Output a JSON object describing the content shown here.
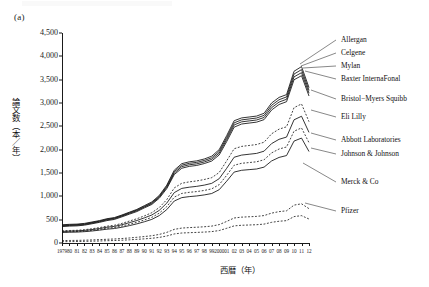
{
  "panel": {
    "label": "(a)"
  },
  "axes": {
    "y_title": "論文数（本／年）",
    "x_title": "西暦（年）",
    "y_ticks": [
      "0",
      "500",
      "1,000",
      "1,500",
      "2,000",
      "2,500",
      "3,000",
      "3,500",
      "4,000",
      "4,500"
    ],
    "x_ticks": [
      "1979",
      "80",
      "81",
      "82",
      "83",
      "84",
      "85",
      "86",
      "87",
      "88",
      "89",
      "90",
      "91",
      "92",
      "93",
      "94",
      "95",
      "96",
      "97",
      "98",
      "99",
      "2000",
      "01",
      "02",
      "03",
      "04",
      "05",
      "06",
      "07",
      "08",
      "09",
      "10",
      "11",
      "12"
    ]
  },
  "legend": {
    "items": [
      {
        "label": "Allergan"
      },
      {
        "label": "Celgene"
      },
      {
        "label": "Mylan"
      },
      {
        "label": "Baxter InternaFonal"
      },
      {
        "label": "Bristol−Myers Squibb"
      },
      {
        "label": "Eli Lilly"
      },
      {
        "label": "Abbott Laboratories"
      },
      {
        "label": "Johnson & Johnson"
      },
      {
        "label": "Merck & Co"
      },
      {
        "label": "Pfizer"
      }
    ]
  },
  "chart_data": {
    "type": "line",
    "title": "",
    "xlabel": "西暦（年）",
    "ylabel": "論文数（本／年）",
    "xlim": [
      1979,
      2012
    ],
    "ylim": [
      0,
      4500
    ],
    "ytick_step": 500,
    "grid": false,
    "legend_position": "right-leader-lines",
    "x": [
      1979,
      1980,
      1981,
      1982,
      1983,
      1984,
      1985,
      1986,
      1987,
      1988,
      1989,
      1990,
      1991,
      1992,
      1993,
      1994,
      1995,
      1996,
      1997,
      1998,
      1999,
      2000,
      2001,
      2002,
      2003,
      2004,
      2005,
      2006,
      2007,
      2008,
      2009,
      2010,
      2011,
      2012
    ],
    "series": [
      {
        "name": "Allergan",
        "style": "solid",
        "values": [
          390,
          400,
          405,
          420,
          450,
          480,
          520,
          545,
          600,
          660,
          720,
          800,
          880,
          1020,
          1240,
          1560,
          1700,
          1740,
          1760,
          1800,
          1860,
          2000,
          2300,
          2620,
          2680,
          2700,
          2720,
          2780,
          3000,
          3120,
          3180,
          3680,
          3780,
          3330
        ]
      },
      {
        "name": "Celgene",
        "style": "solid",
        "values": [
          378,
          388,
          393,
          408,
          438,
          468,
          508,
          533,
          588,
          648,
          706,
          785,
          862,
          1000,
          1215,
          1528,
          1668,
          1708,
          1728,
          1768,
          1826,
          1962,
          2258,
          2575,
          2638,
          2658,
          2678,
          2735,
          2950,
          3070,
          3130,
          3620,
          3715,
          3270
        ]
      },
      {
        "name": "Mylan",
        "style": "solid",
        "values": [
          366,
          376,
          381,
          396,
          426,
          456,
          496,
          521,
          576,
          634,
          692,
          770,
          845,
          982,
          1192,
          1498,
          1636,
          1676,
          1696,
          1736,
          1792,
          1925,
          2216,
          2530,
          2596,
          2616,
          2636,
          2690,
          2900,
          3020,
          3080,
          3560,
          3650,
          3210
        ]
      },
      {
        "name": "Baxter InternaFonal",
        "style": "solid",
        "values": [
          352,
          362,
          367,
          382,
          412,
          442,
          480,
          505,
          560,
          618,
          674,
          752,
          826,
          960,
          1166,
          1466,
          1602,
          1642,
          1662,
          1702,
          1756,
          1886,
          2172,
          2482,
          2550,
          2570,
          2590,
          2644,
          2850,
          2968,
          3028,
          3498,
          3585,
          3150
        ]
      },
      {
        "name": "Bristol−Myers Squibb",
        "style": "dashed",
        "values": [
          260,
          268,
          272,
          285,
          305,
          330,
          360,
          380,
          420,
          470,
          520,
          580,
          650,
          760,
          930,
          1180,
          1280,
          1310,
          1330,
          1360,
          1400,
          1510,
          1760,
          2020,
          2070,
          2090,
          2110,
          2160,
          2340,
          2440,
          2490,
          2900,
          2980,
          2600
        ]
      },
      {
        "name": "Eli Lilly",
        "style": "solid",
        "values": [
          248,
          255,
          259,
          270,
          288,
          310,
          338,
          356,
          392,
          436,
          482,
          538,
          600,
          700,
          855,
          1080,
          1170,
          1196,
          1214,
          1240,
          1278,
          1378,
          1600,
          1838,
          1884,
          1902,
          1920,
          1968,
          2130,
          2222,
          2270,
          2640,
          2716,
          2370
        ]
      },
      {
        "name": "Abbott Laboratories",
        "style": "dashed",
        "values": [
          236,
          242,
          246,
          256,
          272,
          292,
          316,
          332,
          364,
          402,
          444,
          494,
          550,
          640,
          780,
          982,
          1062,
          1086,
          1102,
          1126,
          1160,
          1250,
          1450,
          1666,
          1708,
          1724,
          1740,
          1784,
          1930,
          2014,
          2058,
          2396,
          2466,
          2150
        ]
      },
      {
        "name": "Johnson & Johnson",
        "style": "solid",
        "values": [
          226,
          231,
          234,
          243,
          257,
          275,
          296,
          310,
          338,
          372,
          410,
          455,
          506,
          588,
          716,
          900,
          972,
          994,
          1008,
          1030,
          1060,
          1142,
          1324,
          1520,
          1558,
          1572,
          1586,
          1626,
          1758,
          1834,
          1874,
          2184,
          2248,
          1960
        ]
      },
      {
        "name": "Merck & Co",
        "style": "dashed",
        "values": [
          52,
          54,
          56,
          60,
          66,
          72,
          80,
          86,
          96,
          108,
          122,
          138,
          156,
          184,
          228,
          292,
          320,
          330,
          338,
          348,
          362,
          394,
          462,
          536,
          554,
          562,
          570,
          588,
          640,
          672,
          690,
          812,
          840,
          736
        ]
      },
      {
        "name": "Pfizer",
        "style": "dashed",
        "values": [
          28,
          30,
          32,
          35,
          39,
          43,
          49,
          53,
          60,
          68,
          78,
          89,
          101,
          120,
          150,
          194,
          214,
          221,
          227,
          234,
          244,
          267,
          315,
          367,
          380,
          386,
          392,
          405,
          443,
          466,
          479,
          566,
          586,
          514
        ]
      }
    ]
  }
}
